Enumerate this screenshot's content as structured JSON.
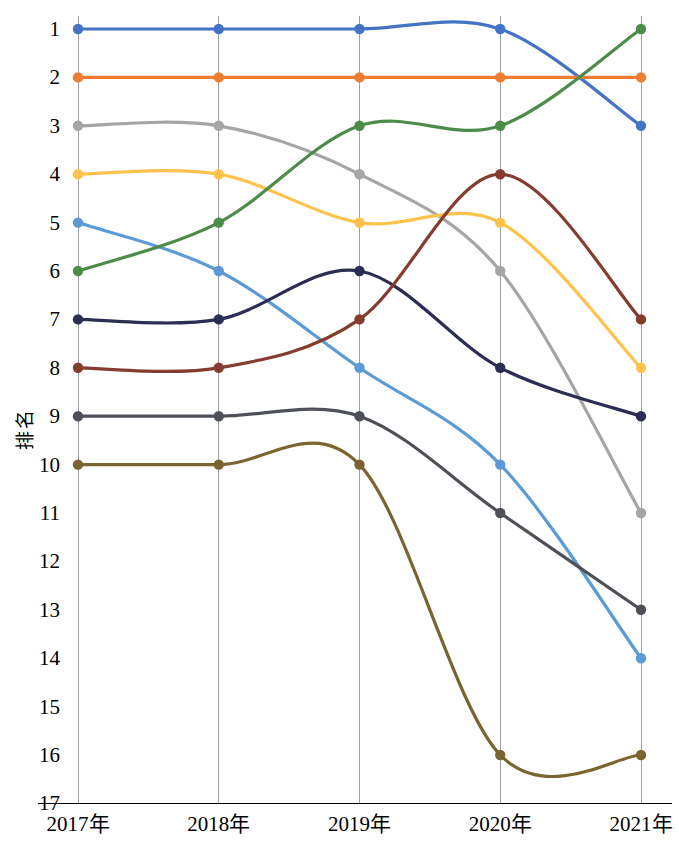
{
  "chart_data": {
    "type": "line",
    "title": "",
    "xlabel": "",
    "ylabel": "排名",
    "categories": [
      "2017年",
      "2018年",
      "2019年",
      "2020年",
      "2021年"
    ],
    "x_tick_labels": [
      "2017年",
      "2018年",
      "2019年",
      "2020年",
      "2021年"
    ],
    "y_tick_labels": [
      "1",
      "2",
      "3",
      "4",
      "5",
      "6",
      "7",
      "8",
      "9",
      "10",
      "11",
      "12",
      "13",
      "14",
      "15",
      "16",
      "17"
    ],
    "ylim": [
      17,
      1
    ],
    "y_inverted": true,
    "grid": "vertical-only",
    "legend": "none",
    "markers": true,
    "smoothing": "spline",
    "series": [
      {
        "name": "series-1",
        "color": "#4573c4",
        "values": [
          1,
          1,
          1,
          1,
          3
        ]
      },
      {
        "name": "series-2",
        "color": "#ed7d31",
        "values": [
          2,
          2,
          2,
          2,
          2
        ]
      },
      {
        "name": "series-3",
        "color": "#a5a5a5",
        "values": [
          3,
          3,
          4,
          6,
          11
        ]
      },
      {
        "name": "series-4",
        "color": "#ffc24c",
        "values": [
          4,
          4,
          5,
          5,
          8
        ]
      },
      {
        "name": "series-5",
        "color": "#5b9bd5",
        "values": [
          5,
          6,
          8,
          10,
          14
        ]
      },
      {
        "name": "series-6",
        "color": "#4d8b48",
        "values": [
          6,
          5,
          3,
          3,
          1
        ]
      },
      {
        "name": "series-7",
        "color": "#2b2d52",
        "values": [
          7,
          7,
          6,
          8,
          9
        ]
      },
      {
        "name": "series-8",
        "color": "#843c2f",
        "values": [
          8,
          8,
          7,
          4,
          7
        ]
      },
      {
        "name": "series-9",
        "color": "#4d5157",
        "values": [
          9,
          9,
          9,
          11,
          13
        ]
      },
      {
        "name": "series-10",
        "color": "#7b6430",
        "values": [
          10,
          10,
          10,
          16,
          16
        ]
      }
    ]
  }
}
